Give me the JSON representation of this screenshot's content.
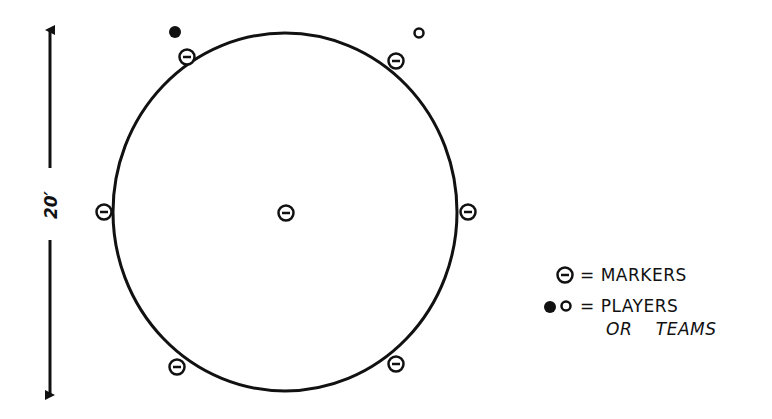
{
  "diagram": {
    "type": "game-field-layout",
    "field": {
      "shape": "circle",
      "center": [
        285,
        212
      ],
      "rx": 172,
      "ry": 179
    },
    "dimension": {
      "label": "20′",
      "orientation": "vertical",
      "x": 50,
      "y_start": 28,
      "y_end": 397
    },
    "markers": [
      {
        "id": "center",
        "x": 286,
        "y": 213
      },
      {
        "id": "top-left",
        "x": 187,
        "y": 57
      },
      {
        "id": "top-right",
        "x": 396,
        "y": 61
      },
      {
        "id": "left",
        "x": 104,
        "y": 212
      },
      {
        "id": "right",
        "x": 468,
        "y": 212
      },
      {
        "id": "bottom-left",
        "x": 177,
        "y": 367
      },
      {
        "id": "bottom-right",
        "x": 396,
        "y": 364
      }
    ],
    "players": [
      {
        "id": "player-filled",
        "style": "filled",
        "x": 175,
        "y": 32
      },
      {
        "id": "player-open",
        "style": "open",
        "x": 419,
        "y": 33
      }
    ]
  },
  "legend": {
    "markers_label": "= MARKERS",
    "players_label": "= PLAYERS",
    "players_label_line2": "OR    TEAMS"
  },
  "colors": {
    "ink": "#111111",
    "background": "#ffffff"
  }
}
